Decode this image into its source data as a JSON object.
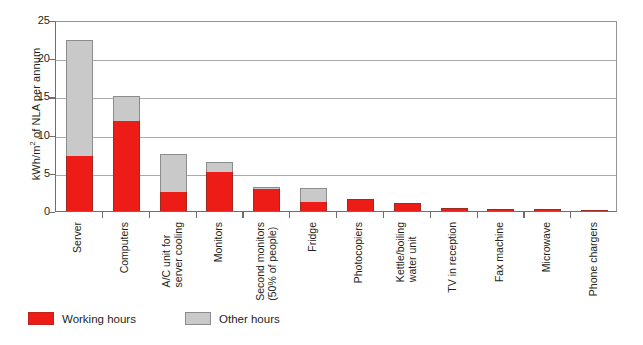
{
  "chart_data": {
    "type": "bar",
    "subtype": "stacked-vertical",
    "title": "",
    "xlabel": "",
    "ylabel": "kWh/m2 of NLA per annum",
    "ylabel_parts": {
      "prefix": "kWh/m",
      "superscript": "2",
      "suffix": " of NLA per annum"
    },
    "ylim": [
      0,
      25
    ],
    "yticks": [
      0,
      5,
      10,
      15,
      20,
      25
    ],
    "grid": "horizontal",
    "legend_position": "bottom-left",
    "categories": [
      "Server",
      "Computers",
      "A/C unit for server cooling",
      "Monitors",
      "Second monitors (50% of people)",
      "Fridge",
      "Photocopiers",
      "Kettle/boiling water unit",
      "TV in reception",
      "Fax machine",
      "Microwave",
      "Phone chargers"
    ],
    "category_lines": [
      [
        "Server"
      ],
      [
        "Computers"
      ],
      [
        "A/C unit for",
        "server cooling"
      ],
      [
        "Monitors"
      ],
      [
        "Second monitors",
        "(50% of people)"
      ],
      [
        "Fridge"
      ],
      [
        "Photocopiers"
      ],
      [
        "Kettle/boiling",
        "water unit"
      ],
      [
        "TV in reception"
      ],
      [
        "Fax machine"
      ],
      [
        "Microwave"
      ],
      [
        "Phone chargers"
      ]
    ],
    "series": [
      {
        "name": "Working hours",
        "color": "#ee1c16",
        "values": [
          7.2,
          11.8,
          2.5,
          5.1,
          2.9,
          1.2,
          1.6,
          1.0,
          0.45,
          0.3,
          0.25,
          0.15
        ]
      },
      {
        "name": "Other hours",
        "color": "#c9c9c9",
        "values": [
          15.2,
          3.2,
          5.0,
          1.3,
          0.3,
          1.8,
          0.0,
          0.0,
          0.0,
          0.0,
          0.0,
          0.0
        ]
      }
    ],
    "totals": [
      22.4,
      15.0,
      7.5,
      6.4,
      3.2,
      3.0,
      1.6,
      1.0,
      0.45,
      0.3,
      0.25,
      0.15
    ]
  },
  "legend": {
    "items": [
      {
        "label": "Working hours",
        "color": "#ee1c16",
        "swatch": "work"
      },
      {
        "label": "Other hours",
        "color": "#c9c9c9",
        "swatch": "other"
      }
    ]
  },
  "colors": {
    "working_hours": "#ee1c16",
    "other_hours": "#c9c9c9",
    "axis": "#6d6e71",
    "gridline": "#a7a9ac",
    "text": "#231f20",
    "background": "#ffffff"
  }
}
